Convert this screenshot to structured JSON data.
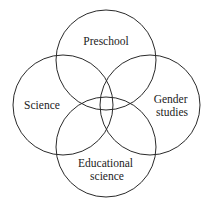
{
  "diagram": {
    "type": "venn",
    "stroke_color": "#2a2a2a",
    "background": "#ffffff",
    "sets": [
      {
        "id": "preschool",
        "label_lines": [
          "Preschool"
        ],
        "circle": {
          "cx": 106,
          "cy": 60,
          "r": 50
        },
        "label_pos": {
          "x": 106,
          "y": 45
        }
      },
      {
        "id": "science",
        "label_lines": [
          "Science"
        ],
        "circle": {
          "cx": 63,
          "cy": 105,
          "r": 50
        },
        "label_pos": {
          "x": 42,
          "y": 109
        }
      },
      {
        "id": "gender-studies",
        "label_lines": [
          "Gender",
          "studies"
        ],
        "circle": {
          "cx": 150,
          "cy": 105,
          "r": 50
        },
        "label_pos": {
          "x": 172,
          "y": 103
        }
      },
      {
        "id": "educational-science",
        "label_lines": [
          "Educational",
          "science"
        ],
        "circle": {
          "cx": 106,
          "cy": 147,
          "r": 50
        },
        "label_pos": {
          "x": 107,
          "y": 167
        }
      }
    ]
  }
}
